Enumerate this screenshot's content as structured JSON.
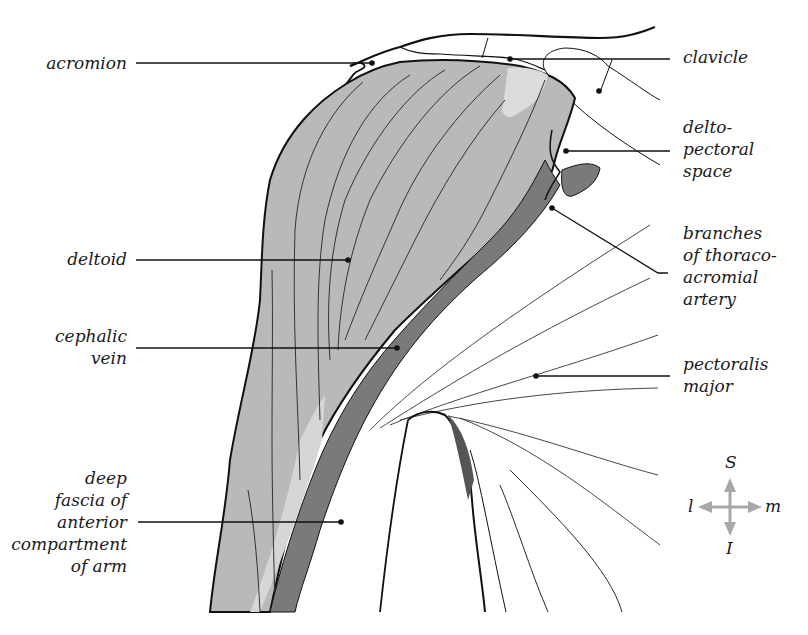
{
  "figure": {
    "colors": {
      "deltoid": "#b8b8b8",
      "deltoid_light": "#d4d4d4",
      "cephalic_vein": "#7a7a7a",
      "outline": "#111111",
      "leader_line": "#111111",
      "compass": "#a8a8a8"
    }
  },
  "labels": {
    "acromion": "acromion",
    "clavicle": "clavicle",
    "deltopectoral_space": "delto-\npectoral\nspace",
    "deltoid": "deltoid",
    "branches_thoracoacromial": "branches\nof thoraco-\nacromial\nartery",
    "cephalic_vein": "cephalic\nvein",
    "pectoralis_major": "pectoralis\nmajor",
    "deep_fascia": "deep\nfascia of\nanterior\ncompartment\nof arm"
  },
  "compass": {
    "superior": "S",
    "inferior": "I",
    "lateral": "l",
    "medial": "m"
  }
}
